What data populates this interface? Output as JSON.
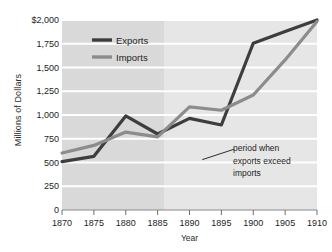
{
  "chart_data": {
    "type": "line",
    "title": "",
    "xlabel": "Year",
    "ylabel": "Millions of Dollars",
    "x": [
      1870,
      1875,
      1880,
      1885,
      1890,
      1895,
      1900,
      1905,
      1910
    ],
    "xlim": [
      1870,
      1910
    ],
    "ylim": [
      0,
      2000
    ],
    "xticks": [
      "1870",
      "1875",
      "1880",
      "1885",
      "1890",
      "1895",
      "1900",
      "1905",
      "1910"
    ],
    "yticks": [
      "0",
      "250",
      "500",
      "750",
      "1,000",
      "1,250",
      "1,500",
      "1,750",
      "$2,000"
    ],
    "ytick_values": [
      0,
      250,
      500,
      750,
      1000,
      1250,
      1500,
      1750,
      2000
    ],
    "grid": true,
    "legend_position": "upper-left-inside",
    "series": [
      {
        "name": "Exports",
        "color": "#3d3d3d",
        "values": [
          510,
          565,
          990,
          800,
          965,
          895,
          1755,
          1880,
          2000
        ]
      },
      {
        "name": "Imports",
        "color": "#8c8c8c",
        "values": [
          600,
          680,
          820,
          770,
          1085,
          1050,
          1210,
          1580,
          1985
        ]
      }
    ],
    "annotations": [
      {
        "text_lines": [
          "period when",
          "exports exceed",
          "imports"
        ],
        "leader_from_x": 1892,
        "leader_from_y": 530,
        "leader_to_x": 1897,
        "leader_to_y": 640
      }
    ],
    "highlight_band": {
      "from_x": 1886,
      "to_x": 1910,
      "note": "lighter shaded region where exports exceed imports"
    },
    "plot_bg": "#d9d9d9",
    "plot_bg_highlight": "#e6e6e6",
    "gridline_color": "#ffffff"
  }
}
